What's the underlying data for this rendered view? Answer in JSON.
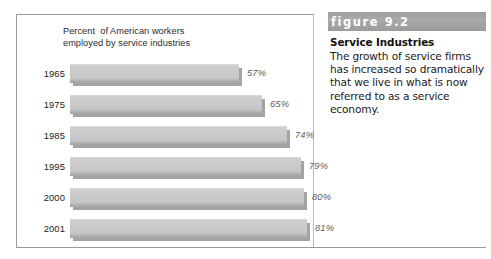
{
  "chart_data": {
    "type": "bar",
    "orientation": "horizontal",
    "title": "Percent  of American workers\nemployed by service industries",
    "title_line1": "Percent  of American workers",
    "title_line2": "employed by service industries",
    "categories": [
      "1965",
      "1975",
      "1985",
      "1995",
      "2000",
      "2001"
    ],
    "values": [
      57,
      65,
      74,
      79,
      80,
      81
    ],
    "value_labels": [
      "57%",
      "65%",
      "74%",
      "79%",
      "80%",
      "81%"
    ],
    "xlabel": "",
    "ylabel": "",
    "xlim": [
      0,
      100
    ],
    "grid": false,
    "legend": false,
    "bar_color": "#c8c8c8",
    "bar_shadow_color": "#a3a3a3"
  },
  "figure": {
    "number_label": "figure 9.2",
    "heading": "Service Industries",
    "body": "The growth of service firms has increased so dramatically that we live in what is now referred to as a service economy.",
    "bar_color": "#a0a0a0"
  }
}
